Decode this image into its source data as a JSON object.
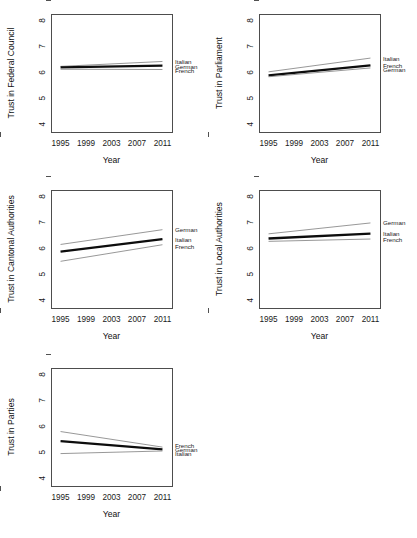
{
  "figure": {
    "name": "trust-by-language-region-panels",
    "background": "#ffffff",
    "thin_line_color": "#8c8c8c",
    "thick_line_color": "#0d0d0d",
    "axis_color": "#4d4d4d"
  },
  "axes": {
    "xlabel": "Year",
    "x_ticks": [
      "1995",
      "1999",
      "2003",
      "2007",
      "2011"
    ],
    "x_tick_values": [
      1995,
      1999,
      2003,
      2007,
      2011
    ],
    "y_ticks": [
      "8",
      "7",
      "6",
      "5",
      "4"
    ],
    "y_tick_values": [
      8,
      7,
      6,
      5,
      4
    ],
    "xlim": [
      1993.5,
      2012.5
    ],
    "ylim": [
      3.7,
      8.25
    ]
  },
  "chart_data": [
    {
      "type": "line",
      "title": "",
      "ylabel": "Trust in Federal Council",
      "xlabel": "Year",
      "x": [
        1995,
        2011
      ],
      "xlim": [
        1993.5,
        2012.5
      ],
      "ylim": [
        3.7,
        8.25
      ],
      "grid": false,
      "legend": "right-inline",
      "series": [
        {
          "name": "Italian",
          "values": [
            6.23,
            6.42
          ],
          "style": "thin",
          "label_y": 6.42
        },
        {
          "name": "German",
          "values": [
            6.19,
            6.26
          ],
          "style": "thick",
          "label_y": 6.24
        },
        {
          "name": "French",
          "values": [
            6.12,
            6.11
          ],
          "style": "thin",
          "label_y": 6.09
        }
      ]
    },
    {
      "type": "line",
      "title": "",
      "ylabel": "Trust in Parliament",
      "xlabel": "Year",
      "x": [
        1995,
        2011
      ],
      "xlim": [
        1993.5,
        2012.5
      ],
      "ylim": [
        3.7,
        8.25
      ],
      "grid": false,
      "legend": "right-inline",
      "series": [
        {
          "name": "Italian",
          "values": [
            6.02,
            6.55
          ],
          "style": "thin",
          "label_y": 6.55
        },
        {
          "name": "French",
          "values": [
            5.88,
            6.27
          ],
          "style": "thick",
          "label_y": 6.26
        },
        {
          "name": "German",
          "values": [
            5.83,
            6.17
          ],
          "style": "thin",
          "label_y": 6.12
        }
      ]
    },
    {
      "type": "line",
      "title": "",
      "ylabel": "Trust in Cantonal Authorities",
      "xlabel": "Year",
      "x": [
        1995,
        2011
      ],
      "xlim": [
        1993.5,
        2012.5
      ],
      "ylim": [
        3.7,
        8.25
      ],
      "grid": false,
      "legend": "right-inline",
      "series": [
        {
          "name": "German",
          "values": [
            6.15,
            6.72
          ],
          "style": "thin",
          "label_y": 6.72
        },
        {
          "name": "Italian",
          "values": [
            5.87,
            6.36
          ],
          "style": "thick",
          "label_y": 6.36
        },
        {
          "name": "French",
          "values": [
            5.5,
            6.14
          ],
          "style": "thin",
          "label_y": 6.08
        }
      ]
    },
    {
      "type": "line",
      "title": "",
      "ylabel": "Trust in Local Authorities",
      "xlabel": "Year",
      "x": [
        1995,
        2011
      ],
      "xlim": [
        1993.5,
        2012.5
      ],
      "ylim": [
        3.7,
        8.25
      ],
      "grid": false,
      "legend": "right-inline",
      "series": [
        {
          "name": "German",
          "values": [
            6.56,
            6.98
          ],
          "style": "thin",
          "label_y": 6.98
        },
        {
          "name": "Italian",
          "values": [
            6.38,
            6.57
          ],
          "style": "thick",
          "label_y": 6.57
        },
        {
          "name": "French",
          "values": [
            6.27,
            6.36
          ],
          "style": "thin",
          "label_y": 6.34
        }
      ]
    },
    {
      "type": "line",
      "title": "",
      "ylabel": "Trust in Parties",
      "xlabel": "Year",
      "x": [
        1995,
        2011
      ],
      "xlim": [
        1993.5,
        2012.5
      ],
      "ylim": [
        3.7,
        8.25
      ],
      "grid": false,
      "legend": "right-inline",
      "series": [
        {
          "name": "French",
          "values": [
            5.8,
            5.2
          ],
          "style": "thin",
          "label_y": 5.26
        },
        {
          "name": "German",
          "values": [
            5.43,
            5.11
          ],
          "style": "thick",
          "label_y": 5.11
        },
        {
          "name": "Italian",
          "values": [
            4.95,
            5.05
          ],
          "style": "thin",
          "label_y": 4.97
        }
      ]
    }
  ]
}
